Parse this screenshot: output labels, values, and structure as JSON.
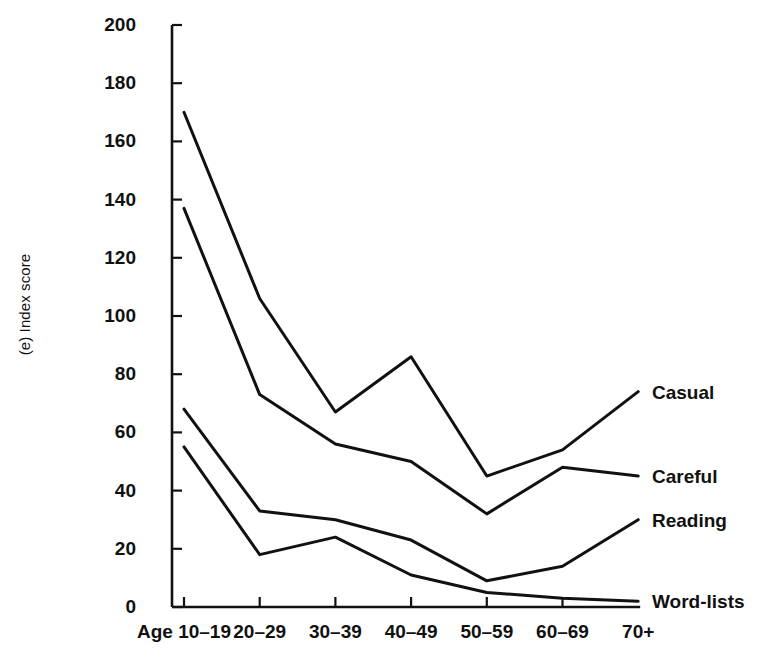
{
  "chart_data": {
    "type": "line",
    "title": "",
    "panel_label": "(e)",
    "xlabel": "",
    "ylabel": "(e) Index score",
    "categories": [
      "Age 10–19",
      "20–29",
      "30–39",
      "40–49",
      "50–59",
      "60–69",
      "70+"
    ],
    "ylim": [
      0,
      200
    ],
    "yticks": [
      0,
      20,
      40,
      60,
      80,
      100,
      120,
      140,
      160,
      180,
      200
    ],
    "ytick_labels": [
      "0",
      "20",
      "40",
      "60",
      "80",
      "100",
      "120",
      "140",
      "160",
      "180",
      "200"
    ],
    "grid": false,
    "legend_position": "right-inline-end-of-line",
    "series": [
      {
        "name": "Casual",
        "values": [
          170,
          106,
          67,
          86,
          45,
          54,
          74
        ]
      },
      {
        "name": "Careful",
        "values": [
          137,
          73,
          56,
          50,
          32,
          48,
          45
        ]
      },
      {
        "name": "Reading",
        "values": [
          68,
          33,
          30,
          23,
          9,
          14,
          30
        ]
      },
      {
        "name": "Word-lists",
        "values": [
          55,
          18,
          24,
          11,
          5,
          3,
          2
        ]
      }
    ],
    "colors": {
      "line": "#111111",
      "axis": "#111111",
      "background": "#ffffff"
    }
  },
  "axis_title": "(e) Index score"
}
